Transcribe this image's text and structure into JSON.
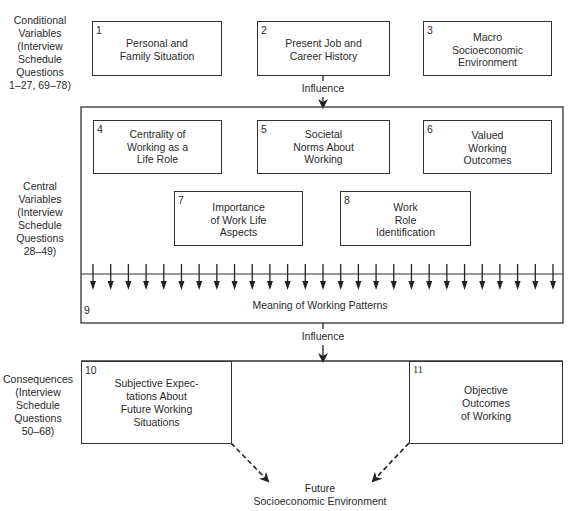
{
  "sections": {
    "conditional": "Conditional\nVariables\n(Interview\nSchedule\nQuestions\n1–27, 69–78)",
    "central": "Central\nVariables\n(Interview\nSchedule\nQuestions\n28–49)",
    "consequences": "Consequences\n(Interview\nSchedule\nQuestions\n50–68)"
  },
  "boxes": [
    {
      "num": "1",
      "text": "Personal and\nFamily Situation"
    },
    {
      "num": "2",
      "text": "Present Job and\nCareer History"
    },
    {
      "num": "3",
      "text": "Macro\nSocioeconomic\nEnvironment"
    },
    {
      "num": "4",
      "text": "Centrality of\nWorking as a\nLife Role"
    },
    {
      "num": "5",
      "text": "Societal\nNorms About\nWorking"
    },
    {
      "num": "6",
      "text": "Valued\nWorking\nOutcomes"
    },
    {
      "num": "7",
      "text": "Importance\nof Work Life\nAspects"
    },
    {
      "num": "8",
      "text": "Work\nRole\nIdentification"
    },
    {
      "num": "9",
      "text": "Meaning of Working Patterns"
    },
    {
      "num": "10",
      "text": "Subjective Expec-\ntations About\nFuture Working\nSituations"
    },
    {
      "num": "11",
      "text": "Objective\nOutcomes\nof Working"
    }
  ],
  "connectors": {
    "influence_top": "Influence",
    "influence_bottom": "Influence",
    "arrow_count": 27
  },
  "outcome": "Future\nSocioeconomic Environment"
}
